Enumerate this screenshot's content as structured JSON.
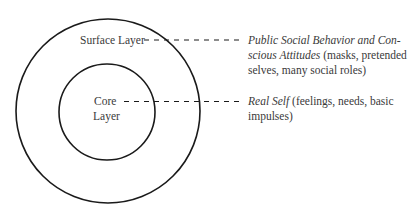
{
  "diagram": {
    "layers": [
      {
        "id": "surface",
        "label": "Surface Layer",
        "description_italic_line1": "Public Social Behavior and Con-",
        "description_italic_line2": "scious Attitudes",
        "description_rest_line2": " (masks, pretended",
        "description_line3": "selves, many social roles)"
      },
      {
        "id": "core",
        "label_line1": "Core",
        "label_line2": "Layer",
        "description_italic_line1": "Real Self",
        "description_rest_line1": " (feelings, needs, basic",
        "description_line2": "impulses)"
      }
    ],
    "colors": {
      "stroke": "#1a1a1a",
      "text": "#3a3a3a",
      "background": "#ffffff"
    }
  }
}
